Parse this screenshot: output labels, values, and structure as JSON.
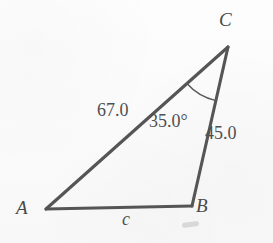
{
  "figure": {
    "kind": "triangle-diagram",
    "background_color": "#fbfbfb",
    "stroke_color": "#555555",
    "text_color": "#4f4f4f",
    "vertices": {
      "a": {
        "label": "A",
        "x": 46,
        "y": 209
      },
      "b": {
        "label": "B",
        "x": 192,
        "y": 206
      },
      "c": {
        "label": "C",
        "x": 228,
        "y": 47
      }
    },
    "sides": {
      "ac": {
        "label": "67.0",
        "value": 67.0,
        "from": "A",
        "to": "C"
      },
      "bc": {
        "label": "45.0",
        "value": 45.0,
        "from": "B",
        "to": "C"
      },
      "ab": {
        "label": "c",
        "value": null,
        "from": "A",
        "to": "B"
      }
    },
    "angles": {
      "c": {
        "label": "35.0°",
        "value": 35.0,
        "at": "C",
        "arc_radius": 55
      }
    }
  },
  "chart_data": {
    "type": "diagram",
    "title": "",
    "shape": "triangle",
    "vertices": [
      "A",
      "B",
      "C"
    ],
    "vertex_points": [
      [
        46,
        209
      ],
      [
        192,
        206
      ],
      [
        228,
        47
      ]
    ],
    "edge_labels": [
      "67.0",
      "45.0",
      "c"
    ],
    "edges": [
      [
        "A",
        "C"
      ],
      [
        "B",
        "C"
      ],
      [
        "A",
        "B"
      ]
    ],
    "angle_labels": [
      "35.0°"
    ],
    "angle_vertices": [
      "C"
    ],
    "angle_values": [
      35.0
    ],
    "known_sides": {
      "b": 67.0,
      "a": 45.0
    },
    "unknown_sides": [
      "c"
    ]
  }
}
